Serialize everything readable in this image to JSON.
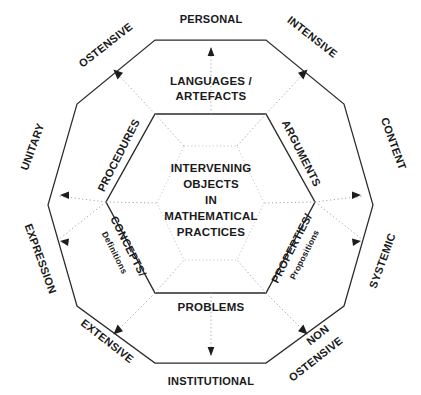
{
  "diagram": {
    "title_center": {
      "lines": [
        "INTERVENING",
        "OBJECTS",
        "IN",
        "MATHEMATICAL",
        "PRACTICES"
      ],
      "l0": "INTERVENING",
      "l1": "OBJECTS",
      "l2": "IN",
      "l3": "MATHEMATICAL",
      "l4": "PRACTICES"
    },
    "colors": {
      "stroke": "#2b2b2b",
      "dotted": "#9a9a9a",
      "text": "#1a1a1a",
      "background": "#ffffff"
    },
    "outer_labels": [
      {
        "id": "personal",
        "text": "PERSONAL"
      },
      {
        "id": "intensive",
        "text": "INTENSIVE"
      },
      {
        "id": "content",
        "text": "CONTENT"
      },
      {
        "id": "systemic",
        "text": "SYSTEMIC"
      },
      {
        "id": "non-ostensive",
        "text": "NON",
        "text2": "OSTENSIVE"
      },
      {
        "id": "institutional",
        "text": "INSTITUTIONAL"
      },
      {
        "id": "extensive",
        "text": "EXTENSIVE"
      },
      {
        "id": "expression",
        "text": "EXPRESSION"
      },
      {
        "id": "unitary",
        "text": "UNITARY"
      },
      {
        "id": "ostensive",
        "text": "OSTENSIVE"
      }
    ],
    "inner_labels": [
      {
        "id": "languages-artefacts",
        "text": "LANGUAGES /",
        "text2": "ARTEFACTS"
      },
      {
        "id": "arguments",
        "text": "ARGUMENTS"
      },
      {
        "id": "properties",
        "text": "PROPERTIES/",
        "text2": "Propositions"
      },
      {
        "id": "problems",
        "text": "PROBLEMS"
      },
      {
        "id": "concepts",
        "text": "CONCEPTS/",
        "text2": "Definitions"
      },
      {
        "id": "procedures",
        "text": "PROCEDURES"
      }
    ]
  }
}
